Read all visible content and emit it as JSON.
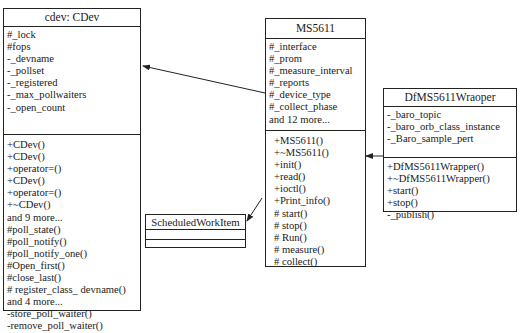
{
  "classes": {
    "cdev": {
      "name": "cdev: CDev",
      "attributes": [
        "#_lock",
        "#fops",
        "-_devname",
        "-_pollset",
        "-_registered",
        "-_max_pollwaiters",
        "-_open_count"
      ],
      "operations": [
        "+CDev()",
        "+CDev()",
        "+operator=()",
        "+CDev()",
        "+operator=()",
        "+~CDev()",
        "and 9 more...",
        "#poll_state()",
        "#poll_notify()",
        "#poll_notify_one()",
        "#Open_first()",
        "#close_last()",
        "# register_class_ devname()",
        "and 4 more...",
        "-store_poll_waiter()",
        "-remove_poll_waiter()"
      ]
    },
    "ms5611": {
      "name": "MS5611",
      "attributes": [
        "#_interface",
        "#_prom",
        "#_measure_interval",
        "#_reports",
        "#_device_type",
        "#_collect_phase",
        "and 12 more..."
      ],
      "operations": [
        "+MS5611()",
        "+~MS5611()",
        "+init()",
        "+read()",
        "+ioctl()",
        "+Print_info()",
        "# start()",
        "# stop()",
        "# Run()",
        "# measure()",
        "# collect()"
      ]
    },
    "wrapper": {
      "name": "DfMS5611Wraoper",
      "attributes": [
        "-_baro_topic",
        "-_baro_orb_class_instance",
        "-_Baro_sample_pert"
      ],
      "operations": [
        "+DfMS5611Wrapper()",
        "+~DfMS5611Wrapper()",
        "+start()",
        "+stop()",
        "-_publish()"
      ]
    },
    "scheduled": {
      "name": "ScheduledWorkItem",
      "attributes": [],
      "operations": []
    }
  },
  "relations": [
    {
      "from": "MS5611",
      "to": "cdev: CDev",
      "type": "inheritance-arrow"
    },
    {
      "from": "DfMS5611Wraoper",
      "to": "MS5611",
      "type": "inheritance-arrow"
    },
    {
      "from": "MS5611",
      "to": "ScheduledWorkItem",
      "type": "inheritance-arrow"
    }
  ]
}
